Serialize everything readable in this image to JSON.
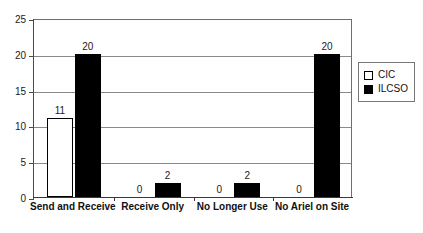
{
  "chart_data": {
    "type": "bar",
    "title": "",
    "subtitle": "",
    "xlabel": "",
    "ylabel": "",
    "ylim": [
      0,
      25
    ],
    "yticks": [
      0,
      5,
      10,
      15,
      20,
      25
    ],
    "ytick_labels": [
      "0",
      "5",
      "10",
      "15",
      "20",
      "25"
    ],
    "grid": true,
    "legend_position": "right",
    "categories": [
      "Send and Receive",
      "Receive Only",
      "No Longer Use",
      "No Ariel on Site"
    ],
    "series": [
      {
        "name": "CIC",
        "values": [
          11,
          0,
          0,
          0
        ],
        "color": "#ffffff",
        "edge_color": "#000000"
      },
      {
        "name": "ILCSO",
        "values": [
          20,
          2,
          2,
          20
        ],
        "color": "#000000",
        "edge_color": "#000000"
      }
    ],
    "data_labels": [
      [
        "11",
        "0",
        "0",
        "0"
      ],
      [
        "20",
        "2",
        "2",
        "20"
      ]
    ]
  },
  "legend": {
    "items": [
      {
        "label": "CIC",
        "swatch": "hollow-square-icon"
      },
      {
        "label": "ILCSO",
        "swatch": "filled-square-icon"
      }
    ]
  }
}
